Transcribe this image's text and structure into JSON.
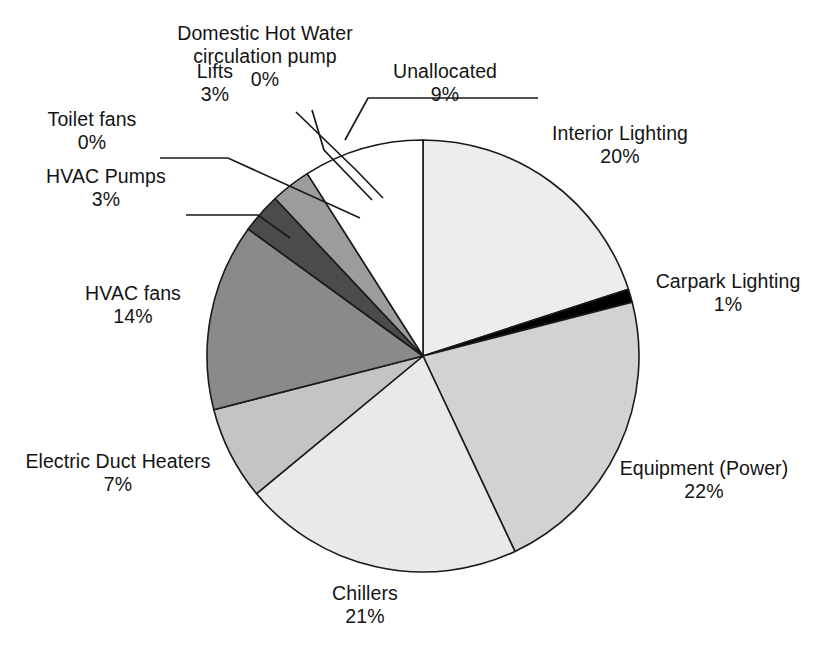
{
  "chart_data": {
    "type": "pie",
    "title": "",
    "subtitle": "",
    "xlabel": "",
    "ylabel": "",
    "legend_position": "none",
    "grid": false,
    "units": "percent",
    "start_angle_deg": 0,
    "direction": "clockwise",
    "categories": [
      "Interior Lighting",
      "Carpark Lighting",
      "Equipment (Power)",
      "Chillers",
      "Electric Duct Heaters",
      "HVAC fans",
      "HVAC Pumps",
      "Toilet fans",
      "Lifts",
      "Domestic Hot Water circulation pump",
      "Unallocated"
    ],
    "values": [
      20,
      1,
      22,
      21,
      7,
      14,
      3,
      0,
      3,
      0,
      9
    ],
    "value_labels": [
      "20%",
      "1%",
      "22%",
      "21%",
      "7%",
      "14%",
      "3%",
      "0%",
      "3%",
      "0%",
      "9%"
    ],
    "slice_colors": [
      "#ededed",
      "#000000",
      "#d2d2d2",
      "#e9e9e9",
      "#c4c4c4",
      "#8a8a8a",
      "#4b4b4b",
      "#b0b0b0",
      "#9c9c9c",
      "#c8c8c8",
      "#ffffff"
    ],
    "slice_outline_color": "#1a1a1a",
    "slices": [
      {
        "label": "Interior Lighting",
        "value_label": "20%",
        "value": 20,
        "color": "#ededed"
      },
      {
        "label": "Carpark Lighting",
        "value_label": "1%",
        "value": 1,
        "color": "#000000"
      },
      {
        "label": "Equipment (Power)",
        "value_label": "22%",
        "value": 22,
        "color": "#d2d2d2"
      },
      {
        "label": "Chillers",
        "value_label": "21%",
        "value": 21,
        "color": "#e9e9e9"
      },
      {
        "label": "Electric Duct Heaters",
        "value_label": "7%",
        "value": 7,
        "color": "#c4c4c4"
      },
      {
        "label": "HVAC fans",
        "value_label": "14%",
        "value": 14,
        "color": "#8a8a8a"
      },
      {
        "label": "HVAC Pumps",
        "value_label": "3%",
        "value": 3,
        "color": "#4b4b4b"
      },
      {
        "label": "Toilet fans",
        "value_label": "0%",
        "value": 0,
        "color": "#b0b0b0"
      },
      {
        "label": "Lifts",
        "value_label": "3%",
        "value": 3,
        "color": "#9c9c9c"
      },
      {
        "label": "Domestic Hot Water circulation pump",
        "value_label": "0%",
        "value": 0,
        "color": "#c8c8c8"
      },
      {
        "label": "Unallocated",
        "value_label": "9%",
        "value": 9,
        "color": "#ffffff"
      }
    ]
  },
  "labels": {
    "domestic_hot_water": {
      "line1": "Domestic Hot Water",
      "line2": "circulation pump",
      "value": "0%"
    },
    "unallocated": {
      "name": "Unallocated",
      "value": "9%"
    },
    "lifts": {
      "name": "Lifts",
      "value": "3%"
    },
    "toilet_fans": {
      "name": "Toilet fans",
      "value": "0%"
    },
    "hvac_pumps": {
      "name": "HVAC Pumps",
      "value": "3%"
    },
    "hvac_fans": {
      "name": "HVAC fans",
      "value": "14%"
    },
    "electric_duct_heaters": {
      "name": "Electric Duct Heaters",
      "value": "7%"
    },
    "chillers": {
      "name": "Chillers",
      "value": "21%"
    },
    "equipment_power": {
      "name": "Equipment (Power)",
      "value": "22%"
    },
    "carpark_lighting": {
      "name": "Carpark Lighting",
      "value": "1%"
    },
    "interior_lighting": {
      "name": "Interior Lighting",
      "value": "20%"
    }
  }
}
